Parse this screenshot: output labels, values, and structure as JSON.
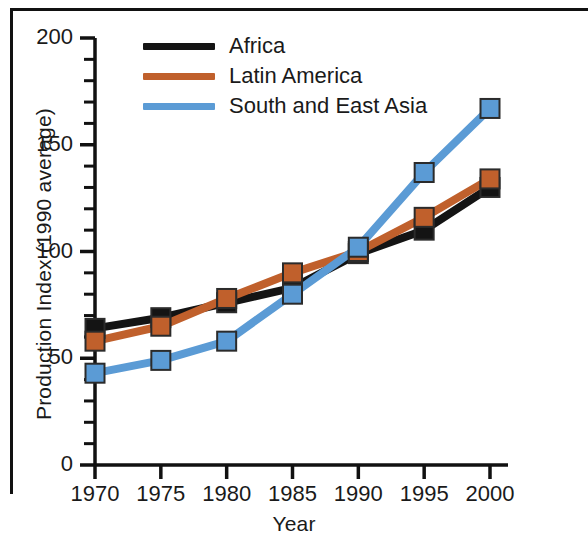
{
  "chart_data": {
    "type": "line",
    "title": "",
    "xlabel": "Year",
    "ylabel": "Production Index (1990 average)",
    "x": [
      1970,
      1975,
      1980,
      1985,
      1990,
      1995,
      2000
    ],
    "xtick_labels": [
      "1970",
      "1975",
      "1980",
      "1985",
      "1990",
      "1995",
      "2000"
    ],
    "ytick_labels": [
      "0",
      "50",
      "100",
      "150",
      "200"
    ],
    "ytick_values": [
      0,
      50,
      100,
      150,
      200
    ],
    "yminor_step": 10,
    "xlim": [
      1967.5,
      2002.5
    ],
    "ylim": [
      0,
      200
    ],
    "grid": false,
    "marker": "square",
    "legend_position": "top-center",
    "series": [
      {
        "name": "Africa",
        "color": "#141414",
        "values": [
          64,
          69,
          76,
          83,
          99,
          110,
          130
        ]
      },
      {
        "name": "Latin America",
        "color": "#C0602C",
        "values": [
          58,
          65,
          78,
          90,
          100,
          116,
          134
        ]
      },
      {
        "name": "South and East Asia",
        "color": "#5B9BD5",
        "values": [
          43,
          49,
          58,
          80,
          102,
          137,
          167
        ]
      }
    ]
  },
  "legend": {
    "entries": [
      {
        "label": "Africa",
        "color": "#141414"
      },
      {
        "label": "Latin America",
        "color": "#C0602C"
      },
      {
        "label": "South and East Asia",
        "color": "#5B9BD5"
      }
    ]
  },
  "axes": {
    "axis_color": "#111111"
  }
}
